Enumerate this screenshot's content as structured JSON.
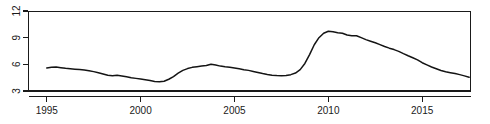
{
  "chart_data": {
    "type": "line",
    "title": "",
    "subtitle": "",
    "xlabel": "",
    "ylabel": "",
    "xlim": [
      1994.0,
      2017.6
    ],
    "ylim": [
      3,
      12
    ],
    "grid": false,
    "legend": null,
    "xticks": [
      1995,
      2000,
      2005,
      2010,
      2015
    ],
    "xtick_labels": [
      "1995",
      "2000",
      "2005",
      "2010",
      "2015"
    ],
    "yticks": [
      3,
      6,
      9,
      12
    ],
    "ytick_labels": [
      "3",
      "6",
      "9",
      "12"
    ],
    "y_axis_label_rotation": "vertical",
    "line_color": "#141414",
    "axis_color": "#1a1a1a",
    "background_color": "#ffffff",
    "series": [
      {
        "name": "value",
        "x": [
          1995.0,
          1995.25,
          1995.5,
          1995.75,
          1996.0,
          1996.25,
          1996.5,
          1996.75,
          1997.0,
          1997.25,
          1997.5,
          1997.75,
          1998.0,
          1998.25,
          1998.5,
          1998.75,
          1999.0,
          1999.25,
          1999.5,
          1999.75,
          2000.0,
          2000.25,
          2000.5,
          2000.75,
          2001.0,
          2001.25,
          2001.5,
          2001.75,
          2002.0,
          2002.25,
          2002.5,
          2002.75,
          2003.0,
          2003.25,
          2003.5,
          2003.75,
          2004.0,
          2004.25,
          2004.5,
          2004.75,
          2005.0,
          2005.25,
          2005.5,
          2005.75,
          2006.0,
          2006.25,
          2006.5,
          2006.75,
          2007.0,
          2007.25,
          2007.5,
          2007.75,
          2008.0,
          2008.25,
          2008.5,
          2008.75,
          2009.0,
          2009.25,
          2009.5,
          2009.75,
          2010.0,
          2010.25,
          2010.5,
          2010.75,
          2011.0,
          2011.25,
          2011.5,
          2011.75,
          2012.0,
          2012.25,
          2012.5,
          2012.75,
          2013.0,
          2013.25,
          2013.5,
          2013.75,
          2014.0,
          2014.25,
          2014.5,
          2014.75,
          2015.0,
          2015.25,
          2015.5,
          2015.75,
          2016.0,
          2016.25,
          2016.5,
          2016.75,
          2017.0,
          2017.25,
          2017.5
        ],
        "values": [
          5.6,
          5.68,
          5.7,
          5.62,
          5.55,
          5.5,
          5.46,
          5.42,
          5.36,
          5.28,
          5.18,
          5.06,
          4.92,
          4.78,
          4.72,
          4.76,
          4.7,
          4.6,
          4.5,
          4.42,
          4.34,
          4.26,
          4.18,
          4.08,
          4.04,
          4.1,
          4.32,
          4.62,
          5.0,
          5.32,
          5.52,
          5.66,
          5.74,
          5.8,
          5.86,
          6.02,
          5.92,
          5.8,
          5.72,
          5.66,
          5.58,
          5.5,
          5.4,
          5.32,
          5.2,
          5.08,
          4.96,
          4.86,
          4.78,
          4.74,
          4.72,
          4.74,
          4.84,
          5.02,
          5.4,
          6.1,
          7.1,
          8.2,
          9.0,
          9.5,
          9.72,
          9.66,
          9.56,
          9.5,
          9.3,
          9.22,
          9.22,
          9.0,
          8.78,
          8.6,
          8.42,
          8.22,
          8.0,
          7.82,
          7.66,
          7.46,
          7.2,
          6.96,
          6.74,
          6.5,
          6.18,
          5.94,
          5.7,
          5.5,
          5.3,
          5.16,
          5.06,
          4.96,
          4.84,
          4.7,
          4.54
        ]
      }
    ]
  },
  "figure": {
    "width": 490,
    "height": 124,
    "plot_area": {
      "left": 28,
      "top": 11,
      "right": 471,
      "bottom": 91
    }
  }
}
